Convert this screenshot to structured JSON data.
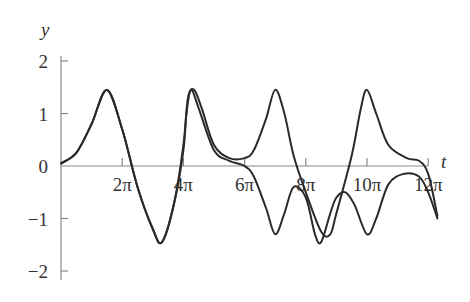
{
  "chart_data": {
    "type": "line",
    "title": "",
    "xlabel": "t",
    "ylabel": "y",
    "xlim_over_pi": [
      0,
      12.4
    ],
    "ylim": [
      -2.1,
      2.2
    ],
    "grid": false,
    "legend": null,
    "x_ticks": [
      {
        "value_over_pi": 2,
        "label": "2π"
      },
      {
        "value_over_pi": 4,
        "label": "4π"
      },
      {
        "value_over_pi": 6,
        "label": "6π"
      },
      {
        "value_over_pi": 8,
        "label": "8π"
      },
      {
        "value_over_pi": 10,
        "label": "10π"
      },
      {
        "value_over_pi": 12,
        "label": "12π"
      }
    ],
    "y_ticks": [
      {
        "value": 2,
        "label": "2"
      },
      {
        "value": 1,
        "label": "1"
      },
      {
        "value": 0,
        "label": "0"
      },
      {
        "value": -1,
        "label": "−1"
      },
      {
        "value": -2,
        "label": "−2"
      }
    ],
    "series": [
      {
        "name": "solution A",
        "t_over_pi": [
          0,
          0.5,
          1,
          1.5,
          2,
          2.5,
          3,
          3.3,
          3.7,
          4,
          4.15,
          4.35,
          4.6,
          5,
          5.5,
          6,
          6.3,
          6.7,
          7,
          7.3,
          7.6,
          8,
          8.5,
          8.8,
          9,
          9.5,
          9.8,
          10,
          10.3,
          10.7,
          11.3,
          11.7,
          12,
          12.3
        ],
        "y": [
          0.05,
          0.25,
          0.8,
          1.45,
          0.7,
          -0.4,
          -1.2,
          -1.45,
          -0.7,
          0.4,
          1.3,
          1.45,
          1.1,
          0.4,
          0.15,
          0.15,
          0.3,
          0.9,
          1.45,
          1.0,
          0.2,
          -0.5,
          -1.25,
          -1.3,
          -0.9,
          0.2,
          1.1,
          1.45,
          1.0,
          0.4,
          0.15,
          0.1,
          -0.15,
          -0.95
        ]
      },
      {
        "name": "solution B",
        "t_over_pi": [
          0,
          0.5,
          1,
          1.5,
          2,
          2.5,
          3,
          3.3,
          3.7,
          4,
          4.1,
          4.25,
          4.5,
          5,
          5.5,
          6,
          6.3,
          6.7,
          7,
          7.3,
          7.6,
          8,
          8.3,
          8.5,
          8.8,
          9,
          9.3,
          9.6,
          10,
          10.3,
          10.7,
          11.2,
          11.7,
          12,
          12.3
        ],
        "y": [
          0.05,
          0.25,
          0.8,
          1.45,
          0.7,
          -0.4,
          -1.2,
          -1.45,
          -0.7,
          0.3,
          1.0,
          1.45,
          1.1,
          0.3,
          0.1,
          0.0,
          -0.2,
          -0.8,
          -1.3,
          -0.9,
          -0.4,
          -0.6,
          -1.3,
          -1.45,
          -0.9,
          -0.6,
          -0.5,
          -0.75,
          -1.3,
          -1.0,
          -0.35,
          -0.15,
          -0.2,
          -0.5,
          -1.0
        ]
      }
    ]
  }
}
